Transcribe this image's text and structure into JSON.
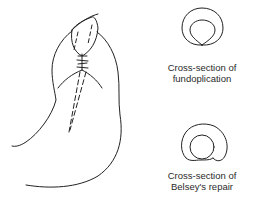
{
  "figure": {
    "stroke_color": "#222222",
    "background": "#ffffff",
    "main_drawing": "stomach with fundoplication wrap around esophagus",
    "cross_sections": [
      {
        "id": "fundoplication",
        "line1": "Cross-section of",
        "line2": "fundoplication"
      },
      {
        "id": "belsey",
        "line1": "Cross-section of",
        "line2": "Belsey's repair"
      }
    ]
  }
}
